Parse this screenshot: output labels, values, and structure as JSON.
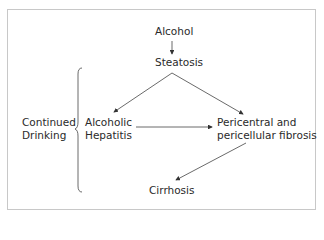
{
  "diagram": {
    "nodes": {
      "alcohol": "Alcohol",
      "steatosis": "Steatosis",
      "hepatitis_line1": "Alcoholic",
      "hepatitis_line2": "Hepatitis",
      "fibrosis_line1": "Pericentral and",
      "fibrosis_line2": "pericellular fibrosis",
      "cirrhosis": "Cirrhosis"
    },
    "side_label": {
      "line1": "Continued",
      "line2": "Drinking"
    },
    "edges": [
      {
        "from": "Alcohol",
        "to": "Steatosis"
      },
      {
        "from": "Steatosis",
        "to": "Alcoholic Hepatitis"
      },
      {
        "from": "Steatosis",
        "to": "Pericentral and pericellular fibrosis"
      },
      {
        "from": "Alcoholic Hepatitis",
        "to": "Pericentral and pericellular fibrosis"
      },
      {
        "from": "Pericentral and pericellular fibrosis",
        "to": "Cirrhosis"
      }
    ]
  }
}
